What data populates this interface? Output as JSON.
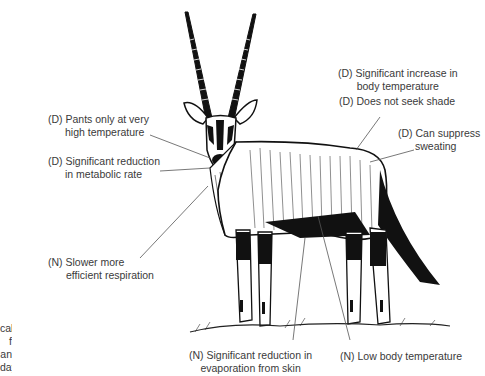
{
  "figure": {
    "labels": [
      {
        "id": "pants",
        "line1": "(D) Pants only at very",
        "line2": "high temperature"
      },
      {
        "id": "metabolic",
        "line1": "(D) Significant reduction",
        "line2": "in metabolic rate"
      },
      {
        "id": "respiration",
        "line1": "(N) Slower more",
        "line2": "efficient respiration"
      },
      {
        "id": "body-temp-increase",
        "line1": "(D) Significant increase in",
        "line2": "body temperature"
      },
      {
        "id": "shade",
        "line1": "(D) Does not seek shade",
        "line2": ""
      },
      {
        "id": "sweating",
        "line1": "(D) Can suppress",
        "line2": "sweating"
      },
      {
        "id": "evaporation",
        "line1": "(N) Significant reduction in",
        "line2": "evaporation from skin"
      },
      {
        "id": "low-body-temp",
        "line1": "(N) Low body temperature",
        "line2": ""
      }
    ],
    "caption_fragment": [
      "cal",
      "f an",
      "day;"
    ]
  }
}
